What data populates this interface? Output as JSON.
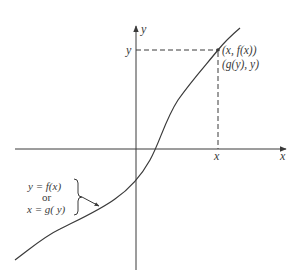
{
  "diagram": {
    "axes": {
      "x_label": "x",
      "y_label": "y"
    },
    "point": {
      "label_line1": "(x, f(x))",
      "label_line2": "(g(y), y)",
      "x_tick_label": "x",
      "y_tick_label": "y"
    },
    "curve_annotation": {
      "line1": "y = f(x)",
      "line2": "or",
      "line3": "x = g( y)"
    },
    "colors": {
      "ink": "#3a3a3a",
      "background": "#ffffff"
    }
  }
}
